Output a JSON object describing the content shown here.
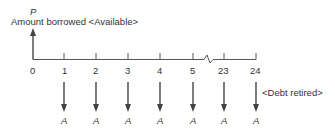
{
  "diagram": {
    "type": "cash-flow-timeline",
    "top_label_symbol": "P",
    "top_label_text": "Amount borrowed <Available>",
    "right_label_text": "<Debt retired>",
    "periods": [
      "0",
      "1",
      "2",
      "3",
      "4",
      "5",
      "23",
      "24"
    ],
    "payment_symbol": "A",
    "payments": [
      "A",
      "A",
      "A",
      "A",
      "A",
      "A",
      "A"
    ],
    "axis_break_between": [
      "5",
      "23"
    ],
    "line_color": "#444444"
  }
}
